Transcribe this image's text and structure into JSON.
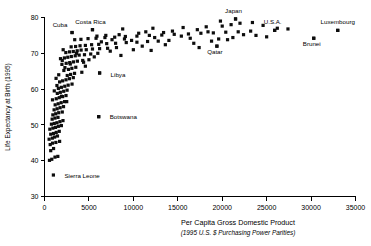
{
  "chart_data": {
    "type": "scatter",
    "title": "",
    "xlabel": "Per Capita Gross Domestic Product",
    "xlabel_sub": "(1995 U.S. $ Purchasing Power Parities)",
    "ylabel": "Life Expectancy at Birth (1995)",
    "xlim": [
      0,
      35000
    ],
    "ylim": [
      30,
      80
    ],
    "xticks": [
      0,
      5000,
      10000,
      15000,
      20000,
      25000,
      30000,
      35000
    ],
    "xtick_labels": [
      "0",
      "5000",
      "10000",
      "15000",
      "20000",
      "25000",
      "30000",
      "35000"
    ],
    "yticks": [
      30,
      40,
      50,
      60,
      70,
      80
    ],
    "ytick_labels": [
      "30",
      "40",
      "50",
      "60",
      "70",
      "80"
    ],
    "grid": false,
    "legend": "none",
    "marker_color": "#0d0d0d",
    "marker_shape": "square",
    "annotations": [
      {
        "label": "Cuba",
        "x": 3100,
        "y": 75.8,
        "dx": -12,
        "dy": -6
      },
      {
        "label": "Costa Rica",
        "x": 5400,
        "y": 76.6,
        "dx": -2,
        "dy": -6
      },
      {
        "label": "Japan",
        "x": 21500,
        "y": 79.6,
        "dx": -2,
        "dy": -6
      },
      {
        "label": "U.S.A.",
        "x": 25900,
        "y": 76.4,
        "dx": -2,
        "dy": -6
      },
      {
        "label": "Luxembourg",
        "x": 33000,
        "y": 76.4,
        "dx": 0,
        "dy": -6
      },
      {
        "label": "Brunei",
        "x": 30300,
        "y": 74.2,
        "dx": -2,
        "dy": 8
      },
      {
        "label": "Qatar",
        "x": 19400,
        "y": 72.0,
        "dx": -2,
        "dy": 8
      },
      {
        "label": "Libya",
        "x": 6200,
        "y": 64.5,
        "dx": 11,
        "dy": 4
      },
      {
        "label": "Botswana",
        "x": 6100,
        "y": 52.3,
        "dx": 11,
        "dy": 2.5
      },
      {
        "label": "Sierra Leone",
        "x": 1000,
        "y": 36.0,
        "dx": 11,
        "dy": 2.5
      }
    ],
    "points": [
      [
        560,
        40.1
      ],
      [
        820,
        40.4
      ],
      [
        1180,
        41.0
      ],
      [
        1500,
        41.2
      ],
      [
        700,
        42.8
      ],
      [
        1020,
        43.4
      ],
      [
        640,
        44.5
      ],
      [
        900,
        44.9
      ],
      [
        1280,
        45.1
      ],
      [
        1700,
        45.4
      ],
      [
        520,
        46.0
      ],
      [
        880,
        46.3
      ],
      [
        1140,
        46.6
      ],
      [
        1460,
        46.9
      ],
      [
        700,
        47.4
      ],
      [
        1020,
        47.6
      ],
      [
        1320,
        47.9
      ],
      [
        1660,
        48.2
      ],
      [
        600,
        48.8
      ],
      [
        940,
        49.1
      ],
      [
        1240,
        49.3
      ],
      [
        1560,
        49.6
      ],
      [
        1900,
        49.8
      ],
      [
        780,
        50.2
      ],
      [
        1100,
        50.4
      ],
      [
        1400,
        50.6
      ],
      [
        1740,
        50.9
      ],
      [
        2080,
        51.2
      ],
      [
        860,
        51.6
      ],
      [
        1180,
        51.9
      ],
      [
        1520,
        52.1
      ],
      [
        6100,
        52.3
      ],
      [
        940,
        52.8
      ],
      [
        1260,
        53.1
      ],
      [
        1600,
        53.4
      ],
      [
        2000,
        53.6
      ],
      [
        1080,
        54.2
      ],
      [
        1420,
        54.5
      ],
      [
        1760,
        54.8
      ],
      [
        2140,
        55.1
      ],
      [
        1200,
        55.6
      ],
      [
        1540,
        55.9
      ],
      [
        1880,
        56.2
      ],
      [
        2260,
        56.5
      ],
      [
        900,
        57.0
      ],
      [
        1320,
        57.3
      ],
      [
        1660,
        57.6
      ],
      [
        2040,
        57.9
      ],
      [
        2420,
        58.2
      ],
      [
        1440,
        58.8
      ],
      [
        1780,
        59.1
      ],
      [
        2160,
        59.4
      ],
      [
        2540,
        59.7
      ],
      [
        1560,
        60.2
      ],
      [
        1900,
        60.5
      ],
      [
        2280,
        60.8
      ],
      [
        2660,
        61.1
      ],
      [
        3100,
        61.4
      ],
      [
        1700,
        62.0
      ],
      [
        2040,
        62.3
      ],
      [
        2420,
        62.6
      ],
      [
        2800,
        62.9
      ],
      [
        3240,
        63.2
      ],
      [
        2560,
        63.8
      ],
      [
        2940,
        64.1
      ],
      [
        3380,
        64.4
      ],
      [
        4200,
        64.7
      ],
      [
        6200,
        64.5
      ],
      [
        2180,
        65.2
      ],
      [
        2700,
        65.5
      ],
      [
        3080,
        65.8
      ],
      [
        3520,
        66.1
      ],
      [
        4600,
        66.4
      ],
      [
        1960,
        66.9
      ],
      [
        2440,
        67.2
      ],
      [
        2840,
        67.4
      ],
      [
        3260,
        67.6
      ],
      [
        3700,
        67.8
      ],
      [
        4300,
        68.0
      ],
      [
        5000,
        68.2
      ],
      [
        1800,
        68.5
      ],
      [
        2240,
        68.7
      ],
      [
        2620,
        68.9
      ],
      [
        3020,
        69.1
      ],
      [
        3460,
        69.3
      ],
      [
        3900,
        69.5
      ],
      [
        4500,
        69.6
      ],
      [
        5200,
        69.8
      ],
      [
        6000,
        70.0
      ],
      [
        2400,
        70.2
      ],
      [
        2820,
        70.4
      ],
      [
        3240,
        70.5
      ],
      [
        3680,
        70.7
      ],
      [
        4120,
        70.9
      ],
      [
        4700,
        71.0
      ],
      [
        5400,
        71.2
      ],
      [
        6200,
        71.3
      ],
      [
        7100,
        71.4
      ],
      [
        8100,
        71.6
      ],
      [
        3000,
        71.8
      ],
      [
        3500,
        71.9
      ],
      [
        4000,
        72.1
      ],
      [
        4600,
        72.2
      ],
      [
        5300,
        72.4
      ],
      [
        6100,
        72.5
      ],
      [
        7000,
        72.7
      ],
      [
        8000,
        72.8
      ],
      [
        9200,
        73.0
      ],
      [
        10400,
        73.1
      ],
      [
        11600,
        73.3
      ],
      [
        12800,
        73.4
      ],
      [
        14000,
        73.6
      ],
      [
        3400,
        73.8
      ],
      [
        4100,
        73.9
      ],
      [
        4900,
        74.1
      ],
      [
        5800,
        74.2
      ],
      [
        6800,
        74.4
      ],
      [
        7900,
        74.5
      ],
      [
        9100,
        74.7
      ],
      [
        10400,
        74.8
      ],
      [
        11800,
        75.0
      ],
      [
        13200,
        75.1
      ],
      [
        14600,
        75.3
      ],
      [
        16200,
        75.4
      ],
      [
        17600,
        75.6
      ],
      [
        19000,
        75.7
      ],
      [
        20400,
        75.9
      ],
      [
        21800,
        76.0
      ],
      [
        23200,
        76.2
      ],
      [
        3100,
        75.8
      ],
      [
        5400,
        76.6
      ],
      [
        8800,
        76.8
      ],
      [
        12200,
        77.0
      ],
      [
        15600,
        77.2
      ],
      [
        18200,
        77.4
      ],
      [
        20000,
        77.6
      ],
      [
        21000,
        78.0
      ],
      [
        22000,
        78.4
      ],
      [
        21500,
        79.6
      ],
      [
        19800,
        79.0
      ],
      [
        23400,
        78.6
      ],
      [
        24600,
        77.8
      ],
      [
        25900,
        76.4
      ],
      [
        19400,
        72.0
      ],
      [
        30300,
        74.2
      ],
      [
        33000,
        76.4
      ],
      [
        18400,
        76.0
      ],
      [
        17200,
        76.6
      ],
      [
        16400,
        74.2
      ],
      [
        15400,
        74.8
      ],
      [
        14400,
        76.2
      ],
      [
        13400,
        75.8
      ],
      [
        12400,
        74.4
      ],
      [
        11400,
        76.0
      ],
      [
        10600,
        75.6
      ],
      [
        9800,
        73.6
      ],
      [
        9000,
        74.0
      ],
      [
        8400,
        75.2
      ],
      [
        7600,
        73.8
      ],
      [
        6900,
        75.0
      ],
      [
        6400,
        73.2
      ],
      [
        5900,
        74.8
      ],
      [
        22400,
        75.2
      ],
      [
        23800,
        75.0
      ],
      [
        25000,
        74.6
      ],
      [
        26200,
        77.0
      ],
      [
        27400,
        76.8
      ],
      [
        21200,
        74.4
      ],
      [
        20600,
        73.8
      ],
      [
        19600,
        74.0
      ],
      [
        18800,
        73.4
      ],
      [
        2000,
        68.0
      ],
      [
        2100,
        71.0
      ],
      [
        2300,
        66.0
      ],
      [
        1600,
        64.0
      ],
      [
        1400,
        61.0
      ],
      [
        1900,
        58.0
      ],
      [
        2500,
        56.5
      ],
      [
        1300,
        63.0
      ],
      [
        1100,
        59.5
      ],
      [
        2900,
        67.0
      ],
      [
        3600,
        70.0
      ],
      [
        4400,
        67.5
      ],
      [
        5600,
        69.0
      ],
      [
        7400,
        70.6
      ],
      [
        8600,
        69.4
      ],
      [
        10000,
        71.0
      ],
      [
        11000,
        72.0
      ],
      [
        12000,
        70.8
      ],
      [
        13600,
        72.4
      ],
      [
        16800,
        72.8
      ],
      [
        17400,
        71.6
      ]
    ]
  }
}
